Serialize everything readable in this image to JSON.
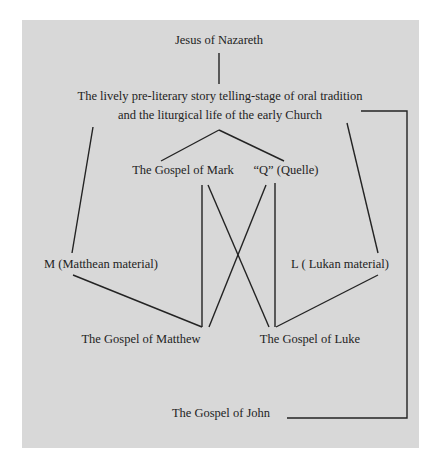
{
  "diagram": {
    "title": "Jesus of Nazareth",
    "oral_tradition": {
      "line1": "The lively pre-literary story telling-stage of oral tradition",
      "line2": "and the liturgical life of the early Church"
    },
    "nodes": {
      "mark": "The Gospel of Mark",
      "q": "“Q” (Quelle)",
      "m": "M (Matthean material)",
      "l": "L ( Lukan material)",
      "matthew": "The Gospel of Matthew",
      "luke": "The Gospel of Luke",
      "john": "The Gospel of John"
    },
    "edges": [
      {
        "from": "Jesus of Nazareth",
        "to": "Oral tradition"
      },
      {
        "from": "Oral tradition",
        "to": "The Gospel of Mark"
      },
      {
        "from": "Oral tradition",
        "to": "“Q” (Quelle)"
      },
      {
        "from": "Oral tradition",
        "to": "M (Matthean material)"
      },
      {
        "from": "Oral tradition",
        "to": "L ( Lukan material)"
      },
      {
        "from": "Oral tradition",
        "to": "The Gospel of John"
      },
      {
        "from": "The Gospel of Mark",
        "to": "The Gospel of Matthew"
      },
      {
        "from": "The Gospel of Mark",
        "to": "The Gospel of Luke"
      },
      {
        "from": "“Q” (Quelle)",
        "to": "The Gospel of Matthew"
      },
      {
        "from": "“Q” (Quelle)",
        "to": "The Gospel of Luke"
      },
      {
        "from": "M (Matthean material)",
        "to": "The Gospel of Matthew"
      },
      {
        "from": "L ( Lukan material)",
        "to": "The Gospel of Luke"
      }
    ],
    "colors": {
      "background": "#d8d8d8",
      "ink": "#232323"
    }
  }
}
